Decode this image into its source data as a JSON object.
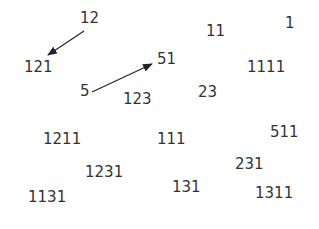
{
  "diagram": {
    "text_color": "#333333",
    "arrow_color": "#222222",
    "labels": [
      {
        "text": "12",
        "x": 80,
        "y": 11
      },
      {
        "text": "121",
        "x": 24,
        "y": 60
      },
      {
        "text": "5",
        "x": 80,
        "y": 84
      },
      {
        "text": "51",
        "x": 157,
        "y": 52
      },
      {
        "text": "123",
        "x": 123,
        "y": 92
      },
      {
        "text": "11",
        "x": 206,
        "y": 24
      },
      {
        "text": "1",
        "x": 285,
        "y": 16
      },
      {
        "text": "1111",
        "x": 247,
        "y": 60
      },
      {
        "text": "23",
        "x": 198,
        "y": 85
      },
      {
        "text": "1211",
        "x": 43,
        "y": 132
      },
      {
        "text": "111",
        "x": 157,
        "y": 132
      },
      {
        "text": "511",
        "x": 270,
        "y": 125
      },
      {
        "text": "1231",
        "x": 85,
        "y": 165
      },
      {
        "text": "231",
        "x": 235,
        "y": 157
      },
      {
        "text": "131",
        "x": 172,
        "y": 180
      },
      {
        "text": "1311",
        "x": 255,
        "y": 186
      },
      {
        "text": "1131",
        "x": 28,
        "y": 190
      }
    ],
    "arrows": [
      {
        "from": "12",
        "to": "121",
        "x1": 84,
        "y1": 31,
        "x2": 48,
        "y2": 55
      },
      {
        "from": "5",
        "to": "51",
        "x1": 92,
        "y1": 92,
        "x2": 152,
        "y2": 64
      }
    ]
  }
}
